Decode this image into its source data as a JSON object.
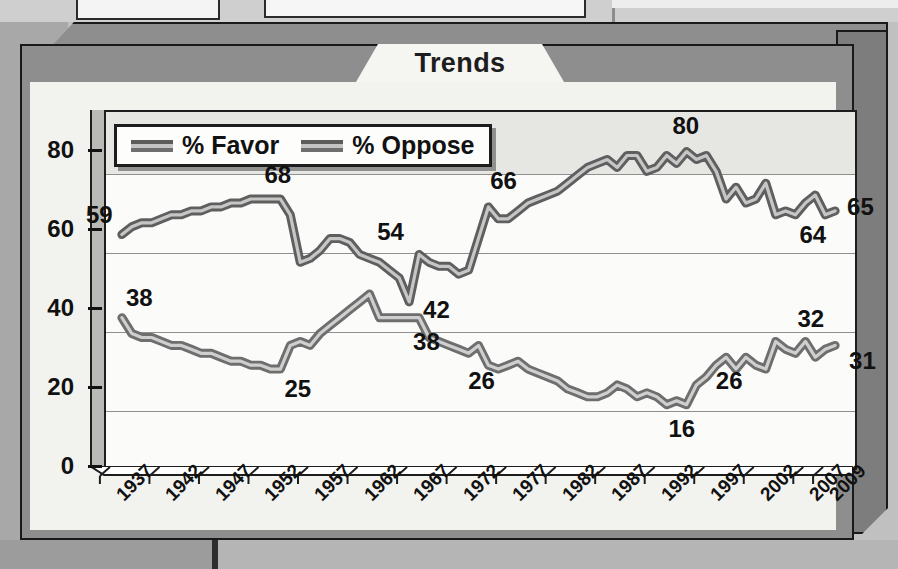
{
  "figure": {
    "title": "Trends"
  },
  "legend": {
    "items": [
      {
        "label": "% Favor",
        "swatch": "line-swatch-favor"
      },
      {
        "label": "% Oppose",
        "swatch": "line-swatch-oppose"
      }
    ]
  },
  "axes": {
    "y_ticks": [
      "0",
      "20",
      "40",
      "60",
      "80"
    ],
    "x_ticks": [
      "1937",
      "1942",
      "1947",
      "1952",
      "1957",
      "1962",
      "1967",
      "1972",
      "1977",
      "1982",
      "1987",
      "1992",
      "1997",
      "2002",
      "2007",
      "2009"
    ]
  },
  "annotations": {
    "favor": [
      "59",
      "68",
      "54",
      "42",
      "66",
      "80",
      "64",
      "65"
    ],
    "oppose": [
      "38",
      "25",
      "38",
      "26",
      "16",
      "26",
      "32",
      "31"
    ]
  },
  "colors": {
    "favor_line": "#5f5f5f",
    "favor_highlight": "#c6c6c6",
    "oppose_line": "#6e6e6e",
    "oppose_highlight": "#cfcfcf",
    "plot_background": "#fbfbf9",
    "band_background": "#e6e6e3",
    "grid": "#8f8f8f",
    "frame": "#1d1d1d",
    "box_face": "#8e8e8e"
  },
  "chart_data": {
    "type": "line",
    "title": "Trends",
    "xlabel": "",
    "ylabel": "",
    "xlim": [
      1936,
      2010
    ],
    "ylim": [
      0,
      90
    ],
    "yticks": [
      0,
      20,
      40,
      60,
      80
    ],
    "grid": true,
    "legend_position": "top-left",
    "series": [
      {
        "name": "% Favor",
        "color": "#5f5f5f",
        "labeled_points": [
          {
            "x": 1937,
            "y": 59,
            "label": "59"
          },
          {
            "x": 1953,
            "y": 68,
            "label": "68"
          },
          {
            "x": 1966,
            "y": 54,
            "label": "54"
          },
          {
            "x": 1967,
            "y": 42,
            "label": "42"
          },
          {
            "x": 1976,
            "y": 66,
            "label": "66"
          },
          {
            "x": 1994,
            "y": 80,
            "label": "80"
          },
          {
            "x": 2005,
            "y": 64,
            "label": "64"
          },
          {
            "x": 2009,
            "y": 65,
            "label": "65"
          }
        ],
        "x": [
          1937,
          1938,
          1939,
          1940,
          1941,
          1942,
          1943,
          1944,
          1945,
          1946,
          1947,
          1948,
          1949,
          1950,
          1951,
          1952,
          1953,
          1954,
          1955,
          1956,
          1957,
          1958,
          1959,
          1960,
          1961,
          1962,
          1963,
          1964,
          1965,
          1966,
          1967,
          1968,
          1969,
          1970,
          1971,
          1972,
          1973,
          1974,
          1975,
          1976,
          1977,
          1978,
          1979,
          1980,
          1981,
          1982,
          1983,
          1984,
          1985,
          1986,
          1987,
          1988,
          1989,
          1990,
          1991,
          1992,
          1993,
          1994,
          1995,
          1996,
          1997,
          1998,
          1999,
          2000,
          2001,
          2002,
          2003,
          2004,
          2005,
          2006,
          2007,
          2008,
          2009
        ],
        "y": [
          59,
          61,
          62,
          62,
          63,
          64,
          64,
          65,
          65,
          66,
          66,
          67,
          67,
          68,
          68,
          68,
          68,
          64,
          52,
          53,
          55,
          58,
          58,
          57,
          54,
          53,
          52,
          50,
          48,
          42,
          54,
          52,
          51,
          51,
          49,
          50,
          58,
          66,
          63,
          63,
          65,
          67,
          68,
          69,
          70,
          72,
          74,
          76,
          77,
          78,
          76,
          79,
          79,
          75,
          76,
          79,
          77,
          80,
          78,
          79,
          75,
          68,
          71,
          67,
          68,
          72,
          64,
          65,
          64,
          67,
          69,
          64,
          65
        ]
      },
      {
        "name": "% Oppose",
        "color": "#6e6e6e",
        "labeled_points": [
          {
            "x": 1937,
            "y": 38,
            "label": "38"
          },
          {
            "x": 1953,
            "y": 25,
            "label": "25"
          },
          {
            "x": 1967,
            "y": 38,
            "label": "38"
          },
          {
            "x": 1976,
            "y": 26,
            "label": "26"
          },
          {
            "x": 1994,
            "y": 16,
            "label": "16"
          },
          {
            "x": 2001,
            "y": 26,
            "label": "26"
          },
          {
            "x": 2006,
            "y": 32,
            "label": "32"
          },
          {
            "x": 2009,
            "y": 31,
            "label": "31"
          }
        ],
        "x": [
          1937,
          1938,
          1939,
          1940,
          1941,
          1942,
          1943,
          1944,
          1945,
          1946,
          1947,
          1948,
          1949,
          1950,
          1951,
          1952,
          1953,
          1954,
          1955,
          1956,
          1957,
          1958,
          1959,
          1960,
          1961,
          1962,
          1963,
          1964,
          1965,
          1966,
          1967,
          1968,
          1969,
          1970,
          1971,
          1972,
          1973,
          1974,
          1975,
          1976,
          1977,
          1978,
          1979,
          1980,
          1981,
          1982,
          1983,
          1984,
          1985,
          1986,
          1987,
          1988,
          1989,
          1990,
          1991,
          1992,
          1993,
          1994,
          1995,
          1996,
          1997,
          1998,
          1999,
          2000,
          2001,
          2002,
          2003,
          2004,
          2005,
          2006,
          2007,
          2008,
          2009
        ],
        "y": [
          38,
          34,
          33,
          33,
          32,
          31,
          31,
          30,
          29,
          29,
          28,
          27,
          27,
          26,
          26,
          25,
          25,
          31,
          32,
          31,
          34,
          36,
          38,
          40,
          42,
          44,
          38,
          38,
          38,
          38,
          38,
          33,
          32,
          31,
          30,
          29,
          31,
          26,
          25,
          26,
          27,
          25,
          24,
          23,
          22,
          20,
          19,
          18,
          18,
          19,
          21,
          20,
          18,
          19,
          18,
          16,
          17,
          16,
          21,
          23,
          26,
          28,
          25,
          28,
          26,
          25,
          32,
          30,
          29,
          32,
          28,
          30,
          31
        ]
      }
    ]
  }
}
